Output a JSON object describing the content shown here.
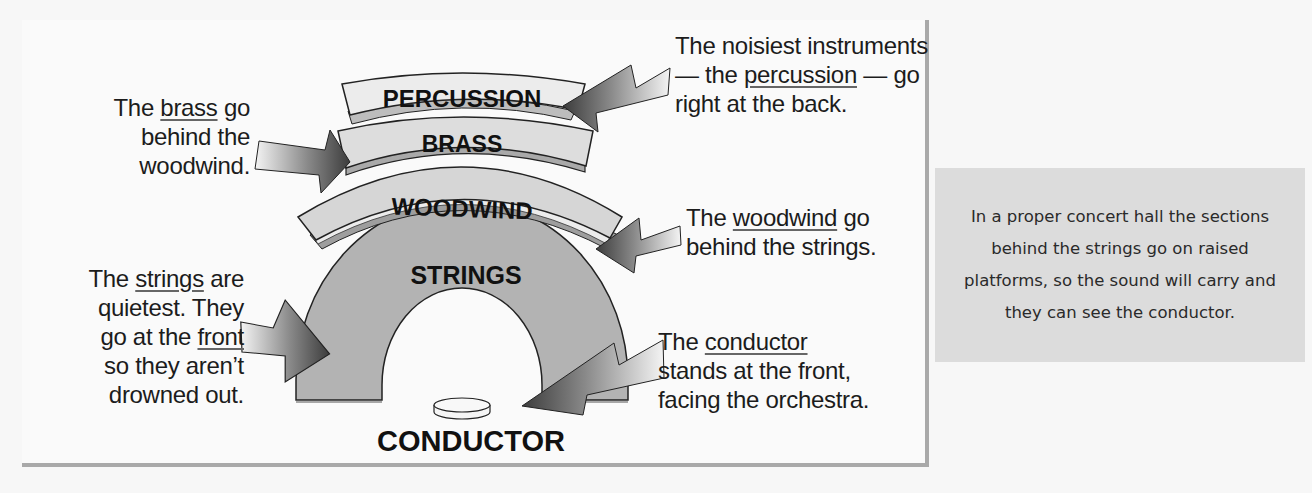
{
  "diagram": {
    "sections": [
      {
        "id": "percussion",
        "label": "PERCUSSION"
      },
      {
        "id": "brass",
        "label": "BRASS"
      },
      {
        "id": "woodwind",
        "label": "WOODWIND"
      },
      {
        "id": "strings",
        "label": "STRINGS"
      },
      {
        "id": "conductor",
        "label": "CONDUCTOR"
      }
    ],
    "annotations": {
      "brass": {
        "pre": "The ",
        "keyword": "brass",
        "post": " go",
        "line2": "behind the",
        "line3": "woodwind."
      },
      "strings": {
        "pre": "The ",
        "keyword": "strings",
        "post": " are",
        "line2": "quietest.  They",
        "line3_pre": "go at the ",
        "line3_keyword": "front",
        "line4": "so they aren’t",
        "line5": "drowned out."
      },
      "percussion": {
        "line1": "The noisiest instruments",
        "line2_pre": "— the ",
        "line2_keyword": "percussion",
        "line2_post": " — go",
        "line3": "right at the back."
      },
      "woodwind": {
        "pre": "The ",
        "keyword": "woodwind",
        "post": " go",
        "line2": "behind the strings."
      },
      "conductor": {
        "pre": "The ",
        "keyword": "conductor",
        "line2": "stands at the front,",
        "line3": "facing the orchestra."
      }
    },
    "note": "In a proper concert hall the sections behind the strings go on raised platforms, so the sound will carry and they can see the conductor.",
    "colors": {
      "percussion_fill": "#ececec",
      "brass_fill": "#dddddd",
      "woodwind_fill": "#d6d6d6",
      "strings_fill": "#b3b3b3",
      "arrow_dark": "#4a4a4a",
      "arrow_light": "#f2f2f2",
      "note_bg": "#dcdcdc",
      "border": "#a9a9a9"
    }
  }
}
